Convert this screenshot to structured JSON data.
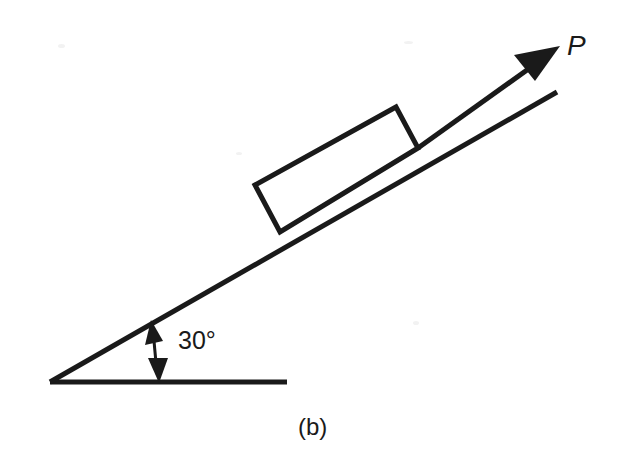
{
  "figure": {
    "caption": "(b)",
    "background_color": "#ffffff",
    "ink_color": "#1a1a1a",
    "width": 621,
    "height": 463
  },
  "diagram": {
    "type": "free-body-inclined-plane",
    "angle": {
      "value": "30",
      "degree_symbol": "°",
      "label": "30°",
      "vertex": [
        50,
        382
      ],
      "dimension_arrow": {
        "from": [
          152,
          322
        ],
        "to": [
          158,
          382
        ],
        "double_headed": true
      },
      "label_position": [
        178,
        349
      ]
    },
    "ground": {
      "name": "horizontal-ground-line",
      "from": [
        50,
        382
      ],
      "to": [
        287,
        382
      ]
    },
    "incline": {
      "name": "inclined-surface-line",
      "from": [
        50,
        382
      ],
      "to": [
        557,
        92
      ]
    },
    "block": {
      "name": "block-on-incline",
      "corners": [
        [
          255,
          185
        ],
        [
          396,
          107
        ],
        [
          418,
          148
        ],
        [
          280,
          232
        ]
      ]
    },
    "force": {
      "name": "applied-force-P",
      "label": "P",
      "label_position": [
        567,
        55
      ],
      "shaft_from": [
        418,
        148
      ],
      "shaft_to": [
        541,
        60
      ],
      "tip": [
        560,
        46
      ],
      "arrowhead": [
        [
          560,
          46
        ],
        [
          516,
          56
        ],
        [
          534,
          80
        ]
      ]
    }
  }
}
